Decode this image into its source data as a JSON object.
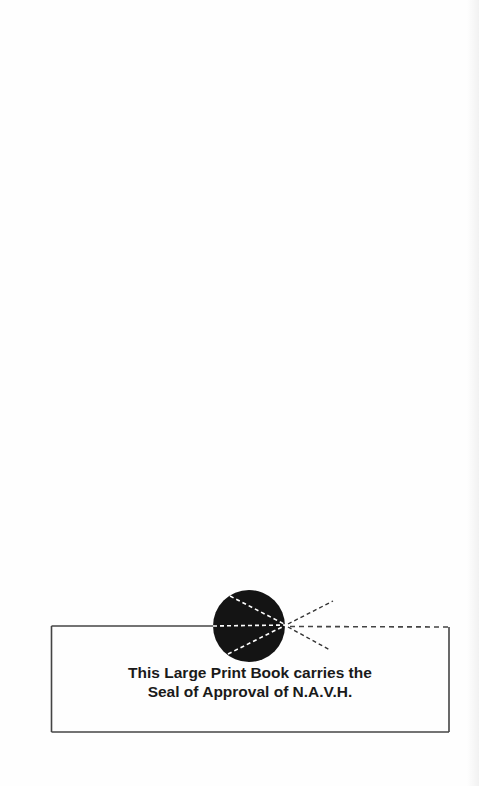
{
  "page": {
    "background": "#fefefe"
  },
  "seal_notice": {
    "line1": "This Large Print Book carries the",
    "line2": "Seal of Approval of N.A.V.H.",
    "seal_icon": "approval-seal-icon",
    "colors": {
      "ink": "#1a1a1a",
      "border": "#444444"
    }
  }
}
